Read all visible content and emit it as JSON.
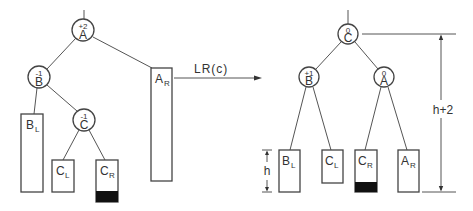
{
  "diagram": {
    "title": "",
    "transformation": {
      "label": "LR(c)",
      "from": "before-tree",
      "to": "after-tree"
    },
    "before": {
      "nodes": [
        {
          "id": "A",
          "letter": "A",
          "balance": "+2"
        },
        {
          "id": "B",
          "letter": "B",
          "balance": "-1"
        },
        {
          "id": "C",
          "letter": "C",
          "balance": "-1"
        }
      ],
      "subtrees": [
        {
          "id": "BL",
          "main": "B",
          "sub": "L",
          "shaded": false
        },
        {
          "id": "CL",
          "main": "C",
          "sub": "L",
          "shaded": false
        },
        {
          "id": "CR",
          "main": "C",
          "sub": "R",
          "shaded": true
        },
        {
          "id": "AR",
          "main": "A",
          "sub": "R",
          "shaded": false
        }
      ]
    },
    "after": {
      "nodes": [
        {
          "id": "C",
          "letter": "C",
          "balance": "0"
        },
        {
          "id": "B",
          "letter": "B",
          "balance": "+1"
        },
        {
          "id": "A",
          "letter": "A",
          "balance": "0"
        }
      ],
      "subtrees": [
        {
          "id": "BL",
          "main": "B",
          "sub": "L",
          "shaded": false
        },
        {
          "id": "CL",
          "main": "C",
          "sub": "L",
          "shaded": false
        },
        {
          "id": "CR",
          "main": "C",
          "sub": "R",
          "shaded": true
        },
        {
          "id": "AR",
          "main": "A",
          "sub": "R",
          "shaded": false
        }
      ],
      "dimensions": {
        "subtree_height": "h",
        "total_height": "h+2"
      }
    },
    "colors": {
      "line": "#555555",
      "shade": "#111111",
      "background": "#ffffff"
    }
  }
}
